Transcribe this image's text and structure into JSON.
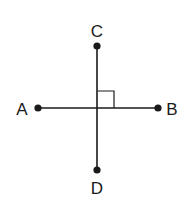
{
  "diagram": {
    "type": "perpendicular-lines",
    "colors": {
      "line": "#1a1a1a",
      "background": "#ffffff"
    },
    "points": [
      {
        "id": "A",
        "label": "A",
        "x": 38,
        "y": 108,
        "label_x": 22,
        "label_y": 115
      },
      {
        "id": "B",
        "label": "B",
        "x": 158,
        "y": 108,
        "label_x": 172,
        "label_y": 115
      },
      {
        "id": "C",
        "label": "C",
        "x": 97,
        "y": 46,
        "label_x": 97,
        "label_y": 37
      },
      {
        "id": "D",
        "label": "D",
        "x": 97,
        "y": 170,
        "label_x": 97,
        "label_y": 194
      }
    ],
    "segments": [
      {
        "id": "AB",
        "from": "A",
        "to": "B"
      },
      {
        "id": "CD",
        "from": "C",
        "to": "D"
      }
    ],
    "right_angle_marker": {
      "at": "intersection",
      "x": 97,
      "y": 108,
      "size": 17,
      "quadrant": "upper-right"
    }
  }
}
